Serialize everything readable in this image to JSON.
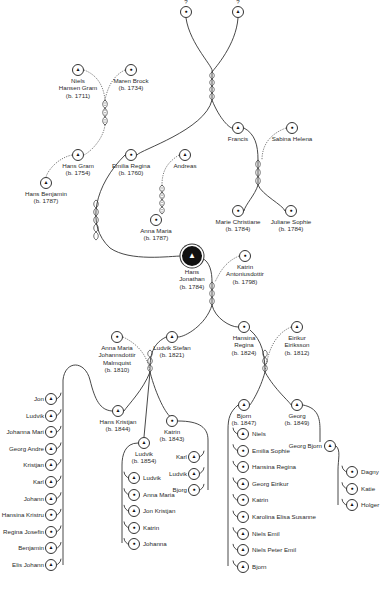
{
  "diagram": {
    "legend": {
      "male": "triangle",
      "female": "dot",
      "focus": "large filled circle"
    },
    "colors": {
      "line": "#333333",
      "focus_fill": "#111111",
      "background": "#ffffff"
    }
  },
  "people": [
    {
      "id": "p0",
      "name": "?",
      "born": "",
      "sex": "f",
      "x": 186,
      "y": 12,
      "label_pos": "top"
    },
    {
      "id": "p1",
      "name": "?",
      "born": "",
      "sex": "m",
      "x": 238,
      "y": 12,
      "label_pos": "top"
    },
    {
      "id": "p2",
      "name": "Niels Hansen Gram",
      "lines": [
        "Niels",
        "Hansen Gram",
        "(b. 1711)"
      ],
      "sex": "m",
      "x": 78,
      "y": 70
    },
    {
      "id": "p3",
      "name": "Maren Brock",
      "lines": [
        "Maren Brock",
        "(b. 1734)"
      ],
      "sex": "f",
      "x": 131,
      "y": 70
    },
    {
      "id": "p4",
      "name": "Hans Gram",
      "lines": [
        "Hans Gram",
        "(b. 1754)"
      ],
      "sex": "m",
      "x": 78,
      "y": 155
    },
    {
      "id": "p5",
      "name": "Emilia Regina",
      "lines": [
        "Emilia Regina",
        "(b. 1760)"
      ],
      "sex": "f",
      "x": 131,
      "y": 155
    },
    {
      "id": "p6",
      "name": "Andreas",
      "lines": [
        "Andreas"
      ],
      "sex": "m",
      "x": 185,
      "y": 155
    },
    {
      "id": "p7",
      "name": "Francis",
      "lines": [
        "Francis"
      ],
      "sex": "m",
      "x": 238,
      "y": 128
    },
    {
      "id": "p8",
      "name": "Sabina Helena",
      "lines": [
        "Sabina Helena"
      ],
      "sex": "f",
      "x": 292,
      "y": 128
    },
    {
      "id": "p9",
      "name": "Hans Benjamin",
      "lines": [
        "Hans Benjamin",
        "(b. 1787)"
      ],
      "sex": "m",
      "x": 46,
      "y": 183
    },
    {
      "id": "p10",
      "name": "Anna Maria",
      "lines": [
        "Anna Maria",
        "(b. 1787)"
      ],
      "sex": "f",
      "x": 156,
      "y": 220
    },
    {
      "id": "p11",
      "name": "Marie Christiane",
      "lines": [
        "Marie Christiane",
        "(b. 1784)"
      ],
      "sex": "f",
      "x": 238,
      "y": 211
    },
    {
      "id": "p12",
      "name": "Juliane Sophie",
      "lines": [
        "Juliane Sophie",
        "(b. 1784)"
      ],
      "sex": "f",
      "x": 291,
      "y": 211
    },
    {
      "id": "p13",
      "name": "Hans Jonathan",
      "lines": [
        "Hans",
        "Jonathan",
        "(b. 1784)"
      ],
      "sex": "m",
      "x": 192,
      "y": 256,
      "focus": true
    },
    {
      "id": "p14",
      "name": "Katrin Antoniusdottir",
      "lines": [
        "Katrin",
        "Antoniusdottir",
        "(b. 1798)"
      ],
      "sex": "f",
      "x": 245,
      "y": 256
    },
    {
      "id": "p15",
      "name": "Anna Maria Johannsdottir Malmquist",
      "lines": [
        "Anna Maria",
        "Johannsdottir",
        "Malmquist",
        "(b. 1810)"
      ],
      "sex": "f",
      "x": 117,
      "y": 337
    },
    {
      "id": "p16",
      "name": "Ludvik Stefan",
      "lines": [
        "Ludvik Stefan",
        "(b. 1821)"
      ],
      "sex": "m",
      "x": 172,
      "y": 337
    },
    {
      "id": "p17",
      "name": "Hansina Regina",
      "lines": [
        "Hansina",
        "Regina",
        "(b. 1824)"
      ],
      "sex": "f",
      "x": 244,
      "y": 327
    },
    {
      "id": "p18",
      "name": "Eirikur Eiriksson",
      "lines": [
        "Eirikur",
        "Eiriksson",
        "(b. 1812)"
      ],
      "sex": "m",
      "x": 297,
      "y": 327
    },
    {
      "id": "p19",
      "name": "Hans Kristjan",
      "lines": [
        "Hans Kristjan",
        "(b. 1844)"
      ],
      "sex": "m",
      "x": 118,
      "y": 411
    },
    {
      "id": "p20",
      "name": "Katrin",
      "lines": [
        "Katrin",
        "(b. 1843)"
      ],
      "sex": "f",
      "x": 172,
      "y": 421
    },
    {
      "id": "p21",
      "name": "Ludvik",
      "lines": [
        "Ludvik",
        "(b. 1854)"
      ],
      "sex": "m",
      "x": 144,
      "y": 443
    },
    {
      "id": "p22",
      "name": "Bjorn",
      "lines": [
        "Bjorn",
        "(b. 1847)"
      ],
      "sex": "m",
      "x": 244,
      "y": 405
    },
    {
      "id": "p23",
      "name": "Georg",
      "lines": [
        "Georg",
        "(b. 1849)"
      ],
      "sex": "m",
      "x": 297,
      "y": 405
    },
    {
      "id": "p24",
      "name": "Georg Bjorn",
      "lines": [
        "Georg Bjorn"
      ],
      "sex": "m",
      "x": 330,
      "y": 446,
      "label_pos": "left"
    }
  ],
  "children_lists": {
    "hans_kristjan": {
      "x": 61,
      "y0": 399,
      "dy": 16.6,
      "label_pos": "left",
      "items": [
        {
          "name": "Jon",
          "sex": "m"
        },
        {
          "name": "Ludvik",
          "sex": "m"
        },
        {
          "name": "Johanna Mari",
          "sex": "f"
        },
        {
          "name": "Georg Andre",
          "sex": "m"
        },
        {
          "name": "Kristjan",
          "sex": "m"
        },
        {
          "name": "Karl",
          "sex": "m"
        },
        {
          "name": "Johann",
          "sex": "m"
        },
        {
          "name": "Hansina Kristru",
          "sex": "f"
        },
        {
          "name": "Regina Josefin",
          "sex": "f"
        },
        {
          "name": "Benjamin",
          "sex": "m"
        },
        {
          "name": "Elis Johann",
          "sex": "m"
        }
      ]
    },
    "ludvik": {
      "x": 124,
      "y0": 478,
      "dy": 16.6,
      "label_pos": "right",
      "items": [
        {
          "name": "Ludvik",
          "sex": "m"
        },
        {
          "name": "Anna Maria",
          "sex": "f"
        },
        {
          "name": "Jon Kristjan",
          "sex": "m"
        },
        {
          "name": "Katrin",
          "sex": "f"
        },
        {
          "name": "Johanna",
          "sex": "f"
        }
      ]
    },
    "katrin": {
      "x": 204,
      "y0": 457,
      "dy": 16.6,
      "label_pos": "left",
      "items": [
        {
          "name": "Karl",
          "sex": "m"
        },
        {
          "name": "Ludvik",
          "sex": "m"
        },
        {
          "name": "Bjorg",
          "sex": "f"
        }
      ]
    },
    "bjorn": {
      "x": 233,
      "y0": 434,
      "dy": 16.6,
      "label_pos": "right",
      "items": [
        {
          "name": "Niels",
          "sex": "m"
        },
        {
          "name": "Emilia Sophie",
          "sex": "f"
        },
        {
          "name": "Hansina Regina",
          "sex": "f"
        },
        {
          "name": "Georg Eirikur",
          "sex": "m"
        },
        {
          "name": "Katrin",
          "sex": "f"
        },
        {
          "name": "Karolina Elisa Susanne",
          "sex": "f"
        },
        {
          "name": "Niels Emil",
          "sex": "m"
        },
        {
          "name": "Niels Peter Emil",
          "sex": "m"
        },
        {
          "name": "Bjorn",
          "sex": "m"
        }
      ]
    },
    "georg_bjorn": {
      "x": 342,
      "y0": 472,
      "dy": 16.6,
      "label_pos": "right",
      "items": [
        {
          "name": "Dagny",
          "sex": "f"
        },
        {
          "name": "Katie",
          "sex": "f"
        },
        {
          "name": "Holger",
          "sex": "m"
        }
      ]
    }
  },
  "connections": {
    "solid": [
      "M186,18 C190,45 215,68 212,72",
      "M238,18 C236,45 215,68 212,72",
      "M212,72 L212,100",
      "M212,100 C205,130 140,150 137,155",
      "M212,100 C220,120 230,128 232,128",
      "M244,128 C255,134 258,145 258,160",
      "M258,160 L258,185",
      "M258,185 C255,195 245,205 244,211",
      "M258,185 C262,195 283,205 285,211",
      "M125,155 C95,185 85,225 110,248 C130,262 170,256 182,256",
      "M202,258 C210,262 212,272 212,282",
      "M212,282 L212,305",
      "M212,305 C206,325 185,337 178,337",
      "M212,305 C215,318 230,327 238,327",
      "M250,330 C262,340 265,355 265,372",
      "M265,372 C260,390 252,402 250,405",
      "M265,372 C275,390 290,402 291,405",
      "M166,337 C150,345 150,360 150,372",
      "M150,372 C143,390 128,405 124,411",
      "M150,372 C156,395 166,415 172,418",
      "M150,372 L144,437",
      "M112,411 C100,410 95,400 90,380 C85,360 65,360 63,380 L63,565",
      "M178,421 C200,421 208,428 208,440 L208,490",
      "M138,443 C125,443 122,455 122,465 L122,543",
      "M238,405 C230,412 228,418 228,430 L228,566",
      "M303,405 C318,408 320,418 320,430 L320,442",
      "M336,446 C341,450 338,460 338,470 L338,505"
    ],
    "dotted": [
      "M84,70 C100,76 104,90 105,100",
      "M125,70 C112,76 107,90 105,100",
      "M105,100 L105,125",
      "M105,125 C103,140 90,152 84,155",
      "M72,155 C58,158 48,170 46,177",
      "M179,155 C168,162 162,170 162,185",
      "M162,185 L162,214",
      "M286,128 C270,134 262,145 262,160",
      "M239,256 C225,262 220,272 215,282",
      "M123,337 C140,345 148,358 150,372",
      "M291,327 C275,334 268,350 265,372"
    ]
  }
}
